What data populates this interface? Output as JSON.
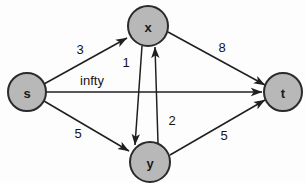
{
  "diagram": {
    "background_color": "#fdfdfd",
    "node_fill": "#b8b8b8",
    "node_stroke": "#2b2b2b",
    "edge_color": "#1f1f1f",
    "nodes": [
      {
        "id": "s",
        "label": "s",
        "cx": 27,
        "cy": 92,
        "r": 19
      },
      {
        "id": "x",
        "label": "x",
        "cx": 148,
        "cy": 26,
        "r": 20
      },
      {
        "id": "y",
        "label": "y",
        "cx": 150,
        "cy": 162,
        "r": 20
      },
      {
        "id": "t",
        "label": "t",
        "cx": 283,
        "cy": 92,
        "r": 19
      }
    ],
    "edges": [
      {
        "id": "s-x",
        "from": "s",
        "to": "x",
        "weight": "3",
        "label_x": 80,
        "label_y": 49
      },
      {
        "id": "s-t",
        "from": "s",
        "to": "t",
        "weight": "infty",
        "label_x": 92,
        "label_y": 80
      },
      {
        "id": "s-y",
        "from": "s",
        "to": "y",
        "weight": "5",
        "label_x": 78,
        "label_y": 133
      },
      {
        "id": "x-y",
        "from": "x",
        "to": "y",
        "weight": "1",
        "label_x": 126,
        "label_y": 62
      },
      {
        "id": "y-x",
        "from": "y",
        "to": "x",
        "weight": "2",
        "label_x": 172,
        "label_y": 120
      },
      {
        "id": "x-t",
        "from": "x",
        "to": "t",
        "weight": "8",
        "label_x": 222,
        "label_y": 47
      },
      {
        "id": "y-t",
        "from": "y",
        "to": "t",
        "weight": "5",
        "label_x": 224,
        "label_y": 135
      }
    ]
  }
}
